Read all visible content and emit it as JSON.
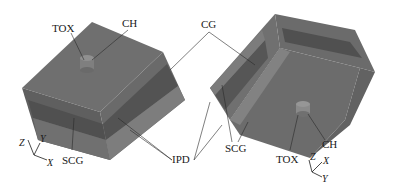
{
  "figure": {
    "type": "3D device structure diagram (two isometric views)",
    "colors": {
      "gate_top": "#6e6e6e",
      "gate_light": "#7a7a7a",
      "cg_band": "#555555",
      "ipd_band": "#808080",
      "scg_face": "#686868",
      "channel": "#8a8a8a",
      "leader": "#2a2a2a",
      "background": "#ffffff"
    }
  },
  "left_view": {
    "labels": {
      "tox": "TOX",
      "ch": "CH",
      "scg": "SCG"
    },
    "axes": {
      "z": "Z",
      "y": "Y",
      "x": "X"
    }
  },
  "right_view": {
    "labels": {
      "scg": "SCG",
      "tox": "TOX",
      "ch": "CH"
    },
    "axes": {
      "z": "Z",
      "x": "X",
      "y": "Y"
    }
  },
  "shared_labels": {
    "cg": "CG",
    "ipd": "IPD"
  }
}
